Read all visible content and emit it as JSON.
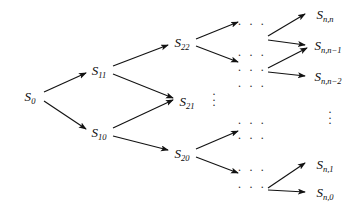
{
  "figure": {
    "type": "recombining-binomial-lattice-diagram",
    "width": 356,
    "height": 210,
    "background_color": "#ffffff",
    "stroke_color": "#121212",
    "text_color": "#0d0d0d"
  },
  "nodes": [
    {
      "id": "s0",
      "base": "S",
      "sub": "0",
      "label": "S0",
      "x": 30,
      "y": 96
    },
    {
      "id": "s11",
      "base": "S",
      "sub": "11",
      "label": "S11",
      "x": 99,
      "y": 70
    },
    {
      "id": "s10",
      "base": "S",
      "sub": "10",
      "label": "S10",
      "x": 99,
      "y": 132
    },
    {
      "id": "s22",
      "base": "S",
      "sub": "22",
      "label": "S22",
      "x": 182,
      "y": 42
    },
    {
      "id": "s21",
      "base": "S",
      "sub": "21",
      "label": "S21",
      "x": 187,
      "y": 101
    },
    {
      "id": "s20",
      "base": "S",
      "sub": "20",
      "label": "S20",
      "x": 182,
      "y": 153
    },
    {
      "id": "snn",
      "base": "S",
      "sub": "n,n",
      "label": "Sn,n",
      "x": 325,
      "y": 14
    },
    {
      "id": "snn1",
      "base": "S",
      "sub": "n,n−1",
      "label": "Sn,n-1",
      "x": 328,
      "y": 45
    },
    {
      "id": "snn2",
      "base": "S",
      "sub": "n,n−2",
      "label": "Sn,n-2",
      "x": 328,
      "y": 76
    },
    {
      "id": "sn1",
      "base": "S",
      "sub": "n,1",
      "label": "Sn,1",
      "x": 325,
      "y": 164
    },
    {
      "id": "sn0",
      "base": "S",
      "sub": "n,0",
      "label": "Sn,0",
      "x": 325,
      "y": 192
    }
  ],
  "edges": [
    {
      "from": "s0",
      "to": "s11",
      "x1": 44,
      "y1": 92,
      "x2": 86,
      "y2": 73
    },
    {
      "from": "s0",
      "to": "s10",
      "x1": 44,
      "y1": 101,
      "x2": 86,
      "y2": 129
    },
    {
      "from": "s11",
      "to": "s22",
      "x1": 113,
      "y1": 66,
      "x2": 168,
      "y2": 45
    },
    {
      "from": "s11",
      "to": "s21",
      "x1": 113,
      "y1": 74,
      "x2": 173,
      "y2": 98
    },
    {
      "from": "s10",
      "to": "s21",
      "x1": 113,
      "y1": 128,
      "x2": 173,
      "y2": 100
    },
    {
      "from": "s10",
      "to": "s20",
      "x1": 113,
      "y1": 136,
      "x2": 168,
      "y2": 150
    },
    {
      "from": "s22",
      "to": "dots-r1",
      "x1": 196,
      "y1": 39,
      "x2": 238,
      "y2": 22
    },
    {
      "from": "s22",
      "to": "dots-r2",
      "x1": 196,
      "y1": 46,
      "x2": 238,
      "y2": 62
    },
    {
      "from": "s20",
      "to": "dots-r3",
      "x1": 196,
      "y1": 149,
      "x2": 238,
      "y2": 131
    },
    {
      "from": "s20",
      "to": "dots-r4",
      "x1": 196,
      "y1": 157,
      "x2": 238,
      "y2": 173
    },
    {
      "from": "dots-r1",
      "to": "snn",
      "x1": 268,
      "y1": 36,
      "x2": 305,
      "y2": 14
    },
    {
      "from": "dots-r1",
      "to": "snn1",
      "x1": 268,
      "y1": 40,
      "x2": 305,
      "y2": 45
    },
    {
      "from": "dots-r2",
      "to": "snn1",
      "x1": 268,
      "y1": 68,
      "x2": 307,
      "y2": 48
    },
    {
      "from": "dots-r2",
      "to": "snn2",
      "x1": 268,
      "y1": 72,
      "x2": 305,
      "y2": 76
    },
    {
      "from": "dots-r4",
      "to": "sn1",
      "x1": 268,
      "y1": 188,
      "x2": 305,
      "y2": 163
    },
    {
      "from": "dots-r4",
      "to": "sn0",
      "x1": 268,
      "y1": 190,
      "x2": 305,
      "y2": 192
    }
  ],
  "horizontal_ellipses": [
    {
      "id": "dots-r1",
      "text": "· · ·",
      "x": 252,
      "y": 24
    },
    {
      "id": "dots-r1b",
      "text": "· · ·",
      "x": 252,
      "y": 55
    },
    {
      "id": "dots-r2",
      "text": "· · ·",
      "x": 252,
      "y": 70
    },
    {
      "id": "dots-r2b",
      "text": "· · ·",
      "x": 252,
      "y": 86
    },
    {
      "id": "dots-r3",
      "text": "· · ·",
      "x": 252,
      "y": 123
    },
    {
      "id": "dots-r3b",
      "text": "· · ·",
      "x": 252,
      "y": 138
    },
    {
      "id": "dots-r4",
      "text": "· · ·",
      "x": 252,
      "y": 170
    },
    {
      "id": "dots-r4b",
      "text": "· · ·",
      "x": 252,
      "y": 187
    }
  ],
  "vertical_ellipses": [
    {
      "id": "dots-v-mid",
      "x": 214,
      "y": 100
    },
    {
      "id": "dots-v-right",
      "x": 330,
      "y": 118
    }
  ]
}
